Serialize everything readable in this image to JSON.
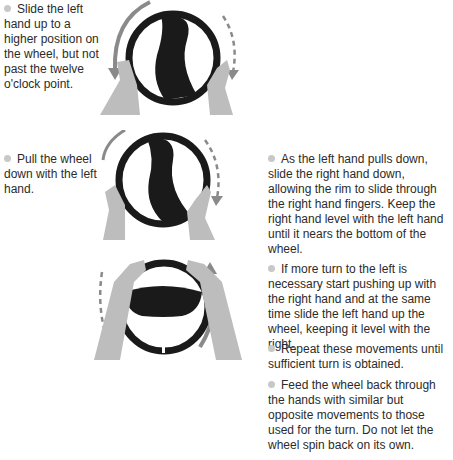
{
  "steps": [
    {
      "text": "Slide the left hand up to a higher position on the wheel, but not past the twelve o'clock point."
    },
    {
      "text": "Pull the wheel down with the left hand."
    },
    {
      "text": "As the left hand pulls down, slide the right hand down, allowing the rim to slide through the right hand fingers. Keep the right hand level with the left hand until it nears the bottom of the wheel."
    },
    {
      "text": "If more turn to the left is necessary start pushing up with the right hand and at the same time slide the left hand up the wheel, keeping it level with the right."
    },
    {
      "text": "Repeat these movements until sufficient turn is obtained."
    },
    {
      "text": "Feed the wheel back through the hands with similar but opposite movements to those used for the turn. Do not let the wheel spin back on its own."
    }
  ],
  "colors": {
    "wheel": "#1a1a1a",
    "hand": "#bdbdbd",
    "arrow": "#8a8a8a",
    "bullet": "#c8c8c8"
  },
  "figures": [
    {
      "name": "left-hand-slides-up"
    },
    {
      "name": "left-hand-pulls-down"
    },
    {
      "name": "right-hand-pushes-up"
    }
  ]
}
